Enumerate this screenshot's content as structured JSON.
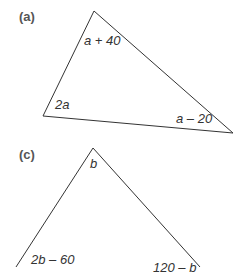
{
  "header": {
    "partial_text": "g"
  },
  "figures": [
    {
      "part_label": "(a)",
      "angles": {
        "top": "a + 40",
        "bottom_left": "2a",
        "bottom_right": "a – 20"
      }
    },
    {
      "part_label": "(c)",
      "angles": {
        "top": "b",
        "bottom_left": "2b – 60",
        "bottom_right": "120 – b"
      }
    }
  ],
  "colors": {
    "line": "#333333",
    "label": "#333333",
    "part_label": "#555555"
  }
}
